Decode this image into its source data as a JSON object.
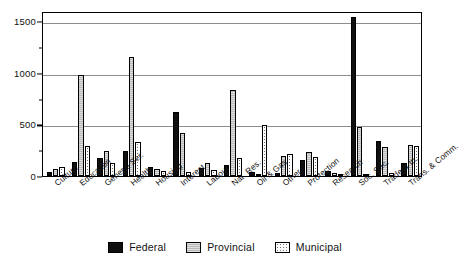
{
  "chart_data": {
    "type": "bar",
    "title": "",
    "xlabel": "",
    "ylabel": "",
    "ylim": [
      0,
      1600
    ],
    "grid": true,
    "legend_position": "bottom-center",
    "y_major_ticks": [
      0,
      500,
      1000,
      1500
    ],
    "y_minor_ticks": [
      250,
      750,
      1250
    ],
    "y_tick_labels": [
      "0",
      "500",
      "1000",
      "1500"
    ],
    "categories": [
      "Culture",
      "Education",
      "General Ser.",
      "Health",
      "Housing",
      "Interest",
      "Labour",
      "Nat. Res.",
      "Oil & Gas",
      "Other",
      "Protection",
      "Research",
      "Soc. Sec.",
      "Trade & In.",
      "Trans. & Comm."
    ],
    "series": [
      {
        "name": "Federal",
        "color": "#101010",
        "values": [
          40,
          135,
          175,
          245,
          85,
          620,
          80,
          110,
          35,
          30,
          160,
          45,
          1540,
          340,
          130
        ]
      },
      {
        "name": "Provincial",
        "color": "#b9b9b9",
        "values": [
          65,
          980,
          240,
          1150,
          70,
          415,
          125,
          830,
          5,
          195,
          235,
          30,
          480,
          280,
          300
        ]
      },
      {
        "name": "Municipal",
        "color": "#ffffff",
        "values": [
          90,
          290,
          125,
          330,
          45,
          35,
          55,
          170,
          490,
          215,
          180,
          10,
          20,
          30,
          290
        ]
      }
    ]
  },
  "legend": {
    "items": [
      {
        "label": "Federal",
        "key": "federal"
      },
      {
        "label": "Provincial",
        "key": "provincial"
      },
      {
        "label": "Municipal",
        "key": "municipal"
      }
    ]
  }
}
